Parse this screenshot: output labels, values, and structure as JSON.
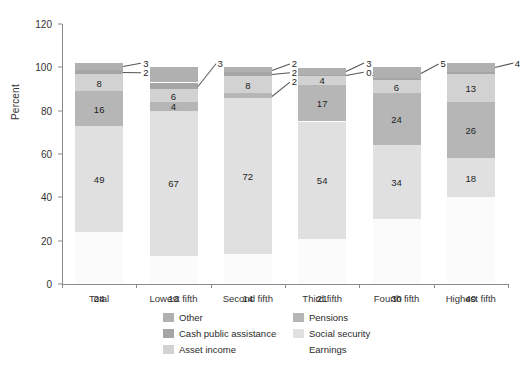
{
  "chart_data": {
    "type": "bar",
    "subtype": "stacked-bar-percent",
    "title": "",
    "xlabel": "",
    "ylabel": "Percent",
    "ylim": [
      0,
      120
    ],
    "yticks": [
      0,
      20,
      40,
      60,
      80,
      100,
      120
    ],
    "ytick_labels": [
      "0",
      "20",
      "40",
      "60",
      "80",
      "100",
      "120"
    ],
    "grid": false,
    "legend_position": "bottom",
    "categories": [
      "Total",
      "Lowest fifth",
      "Second fifth",
      "Third fifth",
      "Fourth fifth",
      "Highest fifth"
    ],
    "series": [
      {
        "name": "Earnings",
        "color": "#fbfbfb",
        "values": [
          24,
          13,
          14,
          21,
          30,
          40
        ],
        "labels": [
          "24",
          "13",
          "14",
          "21",
          "30",
          "40"
        ],
        "label_placement": [
          "below",
          "below",
          "below",
          "below",
          "below",
          "below"
        ]
      },
      {
        "name": "Social security",
        "color": "#e0e0e0",
        "values": [
          49,
          67,
          72,
          54,
          34,
          18
        ],
        "labels": [
          "49",
          "67",
          "72",
          "54",
          "34",
          "18"
        ],
        "label_placement": [
          "inside",
          "inside",
          "inside",
          "inside",
          "inside",
          "inside"
        ]
      },
      {
        "name": "Pensions",
        "color": "#b6b6b6",
        "values": [
          16,
          4,
          2,
          17,
          24,
          26
        ],
        "labels": [
          "16",
          "4",
          "2",
          "17",
          "24",
          "26"
        ],
        "label_placement": [
          "inside",
          "inside",
          "leader",
          "inside",
          "inside",
          "inside"
        ]
      },
      {
        "name": "Asset income",
        "color": "#d2d2d2",
        "values": [
          8,
          6,
          8,
          4,
          6,
          13
        ],
        "labels": [
          "8",
          "6",
          "8",
          "4",
          "6",
          "13"
        ],
        "label_placement": [
          "inside",
          "inside",
          "inside",
          "inside",
          "inside",
          "inside"
        ]
      },
      {
        "name": "Cash public assistance",
        "color": "#a5a5a5",
        "values": [
          2,
          3,
          2,
          0.6,
          1,
          1
        ],
        "labels": [
          "2",
          "3",
          "2",
          "0.6",
          "",
          ""
        ],
        "label_placement": [
          "leader",
          "leader",
          "leader",
          "leader",
          "none",
          "none"
        ]
      },
      {
        "name": "Other",
        "color": "#b0b0b0",
        "values": [
          3,
          7,
          2,
          3,
          5,
          4
        ],
        "labels": [
          "3",
          "",
          "2",
          "3",
          "5",
          "4"
        ],
        "label_placement": [
          "leader",
          "none",
          "leader",
          "leader",
          "leader",
          "leader"
        ]
      }
    ]
  },
  "axis": {
    "y_title": "Percent",
    "y_tick_labels": [
      "0",
      "20",
      "40",
      "60",
      "80",
      "100",
      "120"
    ],
    "x_tick_labels": [
      "Total",
      "Lowest fifth",
      "Second fifth",
      "Third fifth",
      "Fourth fifth",
      "Highest fifth"
    ]
  },
  "legend": {
    "entries": [
      {
        "label": "Other",
        "color": "#b0b0b0",
        "column": "left"
      },
      {
        "label": "Pensions",
        "color": "#b6b6b6",
        "column": "right"
      },
      {
        "label": "Cash public assistance",
        "color": "#a5a5a5",
        "column": "left"
      },
      {
        "label": "Social security",
        "color": "#e0e0e0",
        "column": "right"
      },
      {
        "label": "Asset income",
        "color": "#d2d2d2",
        "column": "left"
      },
      {
        "label": "Earnings",
        "color": "#ffffff",
        "column": "right"
      }
    ]
  },
  "colors": {
    "axis": "#8a8a8a",
    "text": "#2b2b2b",
    "background": "#ffffff",
    "leader_line": "#555555"
  }
}
